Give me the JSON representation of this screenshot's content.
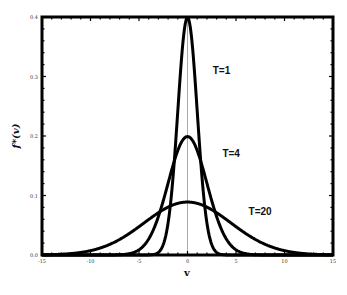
{
  "chart_data": {
    "type": "line",
    "title": "",
    "xlabel": "v",
    "ylabel": "f*(v)",
    "xlim": [
      -15,
      15
    ],
    "ylim": [
      0.0,
      0.4
    ],
    "xticks": [
      -15,
      -10,
      -5,
      0,
      5,
      10,
      15
    ],
    "xtick_labels": [
      "-15",
      "-10",
      "-5",
      "0",
      "5",
      "10",
      "15"
    ],
    "yticks": [
      0.0,
      0.1,
      0.2,
      0.3,
      0.4
    ],
    "ytick_labels": [
      "0.0",
      "0.1",
      "0.2",
      "0.3",
      "0.4"
    ],
    "grid": false,
    "legend": "none (inline curve labels)",
    "reference_line": {
      "x": 0,
      "color": "#aaaaaa"
    },
    "series": [
      {
        "name": "T=1",
        "label": "T=1",
        "peak": 0.399,
        "std": 1.0,
        "label_pos": [
          2.6,
          0.305
        ]
      },
      {
        "name": "T=4",
        "label": "T=4",
        "peak": 0.199,
        "std": 2.0,
        "label_pos": [
          3.6,
          0.165
        ]
      },
      {
        "name": "T=20",
        "label": "T=20",
        "peak": 0.089,
        "std": 4.47,
        "label_pos": [
          6.3,
          0.068
        ]
      }
    ],
    "colors": {
      "curve": "#000000",
      "frame": "#000000",
      "zero_line": "#aaaaaa"
    }
  }
}
